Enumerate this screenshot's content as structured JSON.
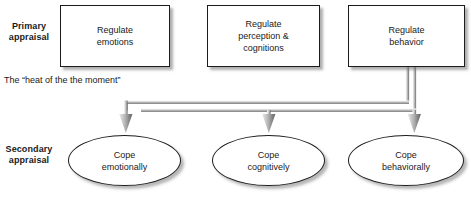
{
  "diagram": {
    "caption": "The “heat of the the moment”",
    "rows": [
      {
        "id": "primary",
        "label": "Primary\nappraisal"
      },
      {
        "id": "secondary",
        "label": "Secondary\nappraisal"
      }
    ],
    "primary_boxes": [
      {
        "id": "regulate-emotions",
        "label": "Regulate\nemotions"
      },
      {
        "id": "regulate-perception-cognitions",
        "label": "Regulate\nperception &\ncognitions"
      },
      {
        "id": "regulate-behavior",
        "label": "Regulate\nbehavior"
      }
    ],
    "secondary_ellipses": [
      {
        "id": "cope-emotionally",
        "label": "Cope\nemotionally"
      },
      {
        "id": "cope-cognitively",
        "label": "Cope\ncognitively"
      },
      {
        "id": "cope-behaviorally",
        "label": "Cope\nbehaviorally"
      }
    ],
    "connectors": [
      {
        "id": "bus-upper",
        "from": "regulate-behavior",
        "to": "cope-emotionally"
      },
      {
        "id": "bus-lower-left",
        "from": "regulate-behavior",
        "to": "cope-cognitively"
      },
      {
        "id": "bus-lower-right",
        "from": "regulate-behavior",
        "to": "cope-behaviorally"
      }
    ],
    "colors": {
      "background": "#ffffff",
      "outline": "#1c1c1c",
      "text": "#1a1a1a",
      "connector_light": "#f0f0f0",
      "connector_dark": "#6e6e6e",
      "shadow": "#9a9a9a"
    }
  }
}
